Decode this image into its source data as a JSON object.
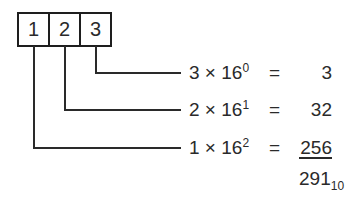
{
  "digits": [
    "1",
    "2",
    "3"
  ],
  "rows": [
    {
      "digit": "3",
      "base": "16",
      "exponent": "0",
      "times": "×",
      "equals": "=",
      "result": "3"
    },
    {
      "digit": "2",
      "base": "16",
      "exponent": "1",
      "times": "×",
      "equals": "=",
      "result": "32"
    },
    {
      "digit": "1",
      "base": "16",
      "exponent": "2",
      "times": "×",
      "equals": "=",
      "result": "256"
    }
  ],
  "total": {
    "value": "291",
    "base_subscript": "10"
  }
}
